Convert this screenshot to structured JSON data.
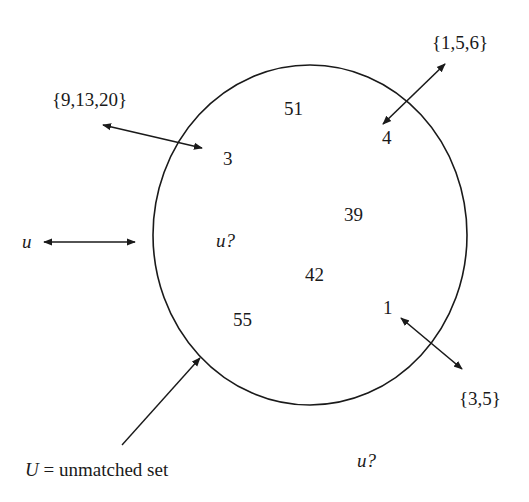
{
  "diagram": {
    "type": "set-diagram",
    "set_name": "U",
    "caption": {
      "variable": "U",
      "equals": "=",
      "text": "unmatched set"
    },
    "inside_elements": [
      {
        "id": "el-51",
        "label": "51"
      },
      {
        "id": "el-4",
        "label": "4"
      },
      {
        "id": "el-3",
        "label": "3"
      },
      {
        "id": "el-39",
        "label": "39"
      },
      {
        "id": "el-u-query",
        "label": "u?"
      },
      {
        "id": "el-42",
        "label": "42"
      },
      {
        "id": "el-55",
        "label": "55"
      },
      {
        "id": "el-1",
        "label": "1"
      }
    ],
    "outside_labels": {
      "set_9_13_20": "{9,13,20}",
      "set_1_5_6": "{1,5,6}",
      "set_3_5": "{3,5}",
      "u_left": "u",
      "u_query_outside": "u?"
    },
    "connections": [
      {
        "from": "{9,13,20}",
        "to": "3",
        "style": "double-arrow"
      },
      {
        "from": "{1,5,6}",
        "to": "4",
        "style": "double-arrow"
      },
      {
        "from": "1",
        "to": "{3,5}",
        "style": "double-arrow"
      },
      {
        "from": "u",
        "to": "U",
        "style": "double-arrow"
      },
      {
        "from": "caption",
        "to": "U-boundary",
        "style": "single-arrow"
      }
    ],
    "colors": {
      "stroke": "#1a1a1a",
      "background": "#ffffff"
    }
  }
}
